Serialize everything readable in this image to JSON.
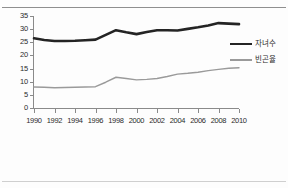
{
  "chart_data": {
    "type": "line",
    "title": "",
    "xlabel": "",
    "ylabel": "",
    "x": [
      1990,
      1991,
      1992,
      1993,
      1994,
      1995,
      1996,
      1997,
      1998,
      1999,
      2000,
      2001,
      2002,
      2003,
      2004,
      2005,
      2006,
      2007,
      2008,
      2009,
      2010
    ],
    "xlim": [
      1990,
      2010
    ],
    "ylim": [
      0,
      35
    ],
    "yticks": [
      0,
      5,
      10,
      15,
      20,
      25,
      30,
      35
    ],
    "xticks": [
      1990,
      1992,
      1994,
      1996,
      1998,
      2000,
      2002,
      2004,
      2006,
      2008,
      2010
    ],
    "grid": false,
    "legend_position": "right",
    "series": [
      {
        "name": "자녀수",
        "color": "#242424",
        "width": 2.6,
        "values": [
          26.5,
          25.9,
          25.5,
          25.5,
          25.6,
          25.8,
          26.0,
          27.8,
          29.6,
          28.8,
          28.1,
          28.9,
          29.6,
          29.6,
          29.5,
          30.1,
          30.7,
          31.4,
          32.3,
          32.1,
          31.9
        ]
      },
      {
        "name": "빈곤율",
        "color": "#9a9a9a",
        "width": 1.4,
        "values": [
          8.0,
          7.9,
          7.7,
          7.8,
          7.9,
          8.0,
          8.1,
          9.8,
          11.7,
          11.2,
          10.7,
          10.9,
          11.2,
          12.0,
          12.9,
          13.2,
          13.6,
          14.2,
          14.7,
          15.1,
          15.3
        ]
      }
    ]
  },
  "yaxis": {
    "labels": [
      "35",
      "30",
      "25",
      "20",
      "15",
      "10",
      "5",
      "0"
    ]
  },
  "xaxis": {
    "labels": [
      "1990",
      "1992",
      "1994",
      "1996",
      "1998",
      "2000",
      "2002",
      "2004",
      "2006",
      "2008",
      "2010"
    ]
  },
  "legend": {
    "entries": [
      {
        "label": "자녀수"
      },
      {
        "label": "빈곤율"
      }
    ]
  }
}
